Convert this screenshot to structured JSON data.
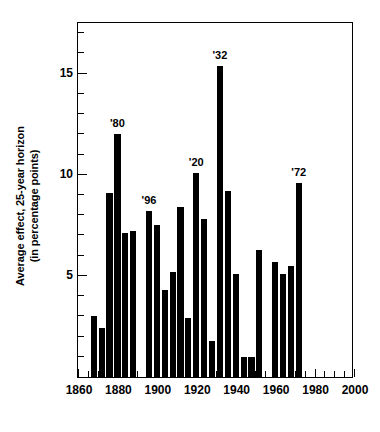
{
  "chart_data": {
    "type": "bar",
    "title": "",
    "xlabel": "",
    "ylabel": "Average effect, 25-year horizon\n(in percentage points)",
    "xlim": [
      1860,
      2000
    ],
    "ylim": [
      0,
      17.6
    ],
    "xticks": [
      1860,
      1880,
      1900,
      1920,
      1940,
      1960,
      1980,
      2000
    ],
    "xtick_labels": [
      "1860",
      "1880",
      "1900",
      "1920",
      "1940",
      "1960",
      "1980",
      "2000"
    ],
    "yticks": [
      5,
      10,
      15
    ],
    "ytick_labels": [
      "5",
      "10",
      "15"
    ],
    "y_minor_ticks": [
      1,
      2,
      3,
      4,
      6,
      7,
      8,
      9,
      11,
      12,
      13,
      14,
      16,
      17
    ],
    "x_minor_ticks": [
      1865,
      1870,
      1875,
      1885,
      1890,
      1895,
      1905,
      1910,
      1915,
      1925,
      1930,
      1935,
      1945,
      1950,
      1955,
      1965,
      1970,
      1975,
      1985,
      1990,
      1995
    ],
    "grid": false,
    "legend": false,
    "bar_color": "#000000",
    "x": [
      1868,
      1872,
      1876,
      1880,
      1884,
      1888,
      1896,
      1900,
      1904,
      1908,
      1912,
      1916,
      1920,
      1924,
      1928,
      1932,
      1936,
      1940,
      1944,
      1948,
      1952,
      1960,
      1964,
      1968,
      1972
    ],
    "values": [
      3.0,
      2.4,
      9.1,
      12.0,
      7.1,
      7.2,
      8.2,
      7.5,
      4.3,
      5.2,
      8.4,
      2.9,
      10.1,
      7.8,
      1.8,
      15.4,
      9.2,
      5.1,
      1.0,
      1.0,
      6.3,
      5.7,
      5.1,
      5.5,
      9.6
    ],
    "annotations": [
      {
        "label": "'80",
        "x": 1880,
        "y": 12.0
      },
      {
        "label": "'96",
        "x": 1896,
        "y": 8.2
      },
      {
        "label": "'20",
        "x": 1920,
        "y": 10.1
      },
      {
        "label": "'32",
        "x": 1932,
        "y": 15.4
      },
      {
        "label": "'72",
        "x": 1972,
        "y": 9.6
      }
    ]
  }
}
